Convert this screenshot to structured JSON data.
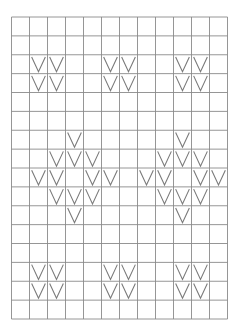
{
  "diagram": {
    "type": "knitting-chart",
    "columns": 12,
    "rows": 16,
    "symbol_name": "knit-stitch-v",
    "symbol_glyph": "V",
    "colors": {
      "grid": "#8a8a8a",
      "symbol": "#7a7a7a",
      "background": "#ffffff"
    },
    "cells": [
      {
        "row": 2,
        "col": 1
      },
      {
        "row": 2,
        "col": 2
      },
      {
        "row": 2,
        "col": 5
      },
      {
        "row": 2,
        "col": 6
      },
      {
        "row": 2,
        "col": 9
      },
      {
        "row": 2,
        "col": 10
      },
      {
        "row": 3,
        "col": 1
      },
      {
        "row": 3,
        "col": 2
      },
      {
        "row": 3,
        "col": 5
      },
      {
        "row": 3,
        "col": 6
      },
      {
        "row": 3,
        "col": 9
      },
      {
        "row": 3,
        "col": 10
      },
      {
        "row": 6,
        "col": 3
      },
      {
        "row": 6,
        "col": 9
      },
      {
        "row": 7,
        "col": 2
      },
      {
        "row": 7,
        "col": 3
      },
      {
        "row": 7,
        "col": 4
      },
      {
        "row": 7,
        "col": 8
      },
      {
        "row": 7,
        "col": 9
      },
      {
        "row": 7,
        "col": 10
      },
      {
        "row": 8,
        "col": 1
      },
      {
        "row": 8,
        "col": 2
      },
      {
        "row": 8,
        "col": 4
      },
      {
        "row": 8,
        "col": 5
      },
      {
        "row": 8,
        "col": 7
      },
      {
        "row": 8,
        "col": 8
      },
      {
        "row": 8,
        "col": 10
      },
      {
        "row": 8,
        "col": 11
      },
      {
        "row": 9,
        "col": 2
      },
      {
        "row": 9,
        "col": 3
      },
      {
        "row": 9,
        "col": 4
      },
      {
        "row": 9,
        "col": 8
      },
      {
        "row": 9,
        "col": 9
      },
      {
        "row": 9,
        "col": 10
      },
      {
        "row": 10,
        "col": 3
      },
      {
        "row": 10,
        "col": 9
      },
      {
        "row": 13,
        "col": 1
      },
      {
        "row": 13,
        "col": 2
      },
      {
        "row": 13,
        "col": 5
      },
      {
        "row": 13,
        "col": 6
      },
      {
        "row": 13,
        "col": 9
      },
      {
        "row": 13,
        "col": 10
      },
      {
        "row": 14,
        "col": 1
      },
      {
        "row": 14,
        "col": 2
      },
      {
        "row": 14,
        "col": 5
      },
      {
        "row": 14,
        "col": 6
      },
      {
        "row": 14,
        "col": 9
      },
      {
        "row": 14,
        "col": 10
      }
    ]
  }
}
